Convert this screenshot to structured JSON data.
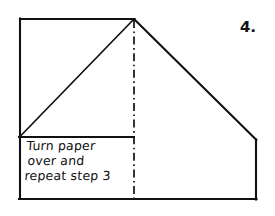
{
  "page": {
    "background_color": "#ffffff",
    "ink_color": "#111111"
  },
  "step": {
    "number_label": "4.",
    "instruction_lines": [
      "Turn paper",
      "over and",
      "repeat step 3"
    ],
    "instruction_full": "Turn paper over and repeat step 3"
  },
  "diagram": {
    "line_color": "#111111",
    "fill_color": "#ffffff",
    "solid_stroke_width": 2.0,
    "fold_stroke_width": 1.6,
    "fold_dash_pattern": "7 3 1.5 3",
    "shapes": {
      "outer_outline_points": "20,19 134,19 256,140 256,199 20,199",
      "top_edge": {
        "x1": 20,
        "y1": 19,
        "x2": 134,
        "y2": 19
      },
      "left_edge": {
        "x1": 20,
        "y1": 19,
        "x2": 20,
        "y2": 199
      },
      "bottom_edge": {
        "x1": 20,
        "y1": 199,
        "x2": 256,
        "y2": 199
      },
      "right_edge": {
        "x1": 256,
        "y1": 140,
        "x2": 256,
        "y2": 199
      },
      "left_diagonal": {
        "x1": 134,
        "y1": 19,
        "x2": 20,
        "y2": 136
      },
      "right_diagonal": {
        "x1": 134,
        "y1": 19,
        "x2": 256,
        "y2": 140
      },
      "text_box_top_edge": {
        "x1": 20,
        "y1": 137,
        "x2": 134,
        "y2": 137
      },
      "fold_line": {
        "x1": 134,
        "y1": 19,
        "x2": 134,
        "y2": 199
      }
    }
  }
}
